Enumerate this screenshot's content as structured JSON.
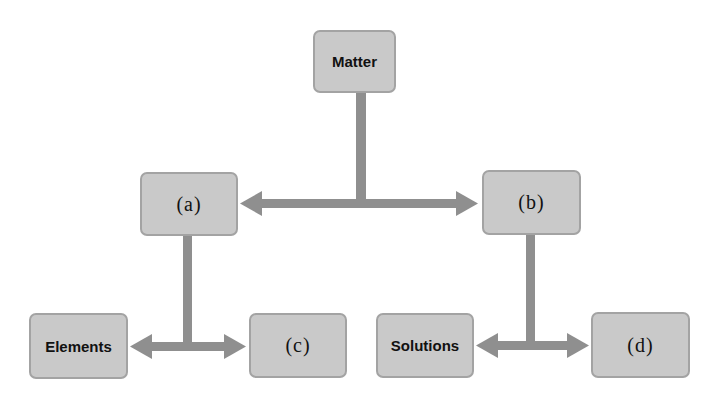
{
  "diagram": {
    "type": "hierarchy",
    "colors": {
      "node_fill": "#c9c9c9",
      "node_border": "#a3a3a3",
      "connector": "#8f8f8f",
      "text": "#111111"
    },
    "nodes": {
      "root": {
        "label": "Matter"
      },
      "a": {
        "label": "(a)"
      },
      "b": {
        "label": "(b)"
      },
      "elements": {
        "label": "Elements"
      },
      "c": {
        "label": "(c)"
      },
      "solutions": {
        "label": "Solutions"
      },
      "d": {
        "label": "(d)"
      }
    },
    "edges": [
      {
        "from": "Matter",
        "to": [
          "(a)",
          "(b)"
        ]
      },
      {
        "from": "(a)",
        "to": [
          "Elements",
          "(c)"
        ]
      },
      {
        "from": "(b)",
        "to": [
          "Solutions",
          "(d)"
        ]
      }
    ]
  }
}
